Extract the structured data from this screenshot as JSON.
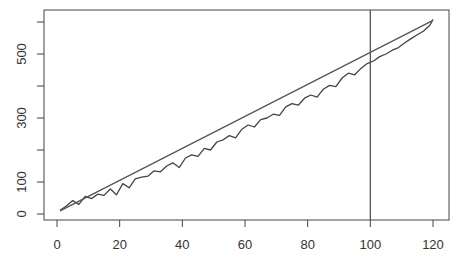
{
  "chart_data": {
    "type": "line",
    "title": "",
    "xlabel": "",
    "ylabel": "",
    "xlim": [
      -3,
      125
    ],
    "ylim": [
      -20,
      640
    ],
    "grid": false,
    "legend": null,
    "x_ticks": [
      0,
      20,
      40,
      60,
      80,
      100,
      120
    ],
    "x_tick_labels": [
      "0",
      "20",
      "40",
      "60",
      "80",
      "100",
      "120"
    ],
    "y_ticks": [
      0,
      100,
      200,
      300,
      400,
      500,
      600
    ],
    "y_tick_labels": [
      "0",
      "100",
      "",
      "300",
      "",
      "500",
      ""
    ],
    "annotations": [
      {
        "type": "vline",
        "x": 100,
        "color": "#555555"
      }
    ],
    "series": [
      {
        "name": "observed",
        "color": "#444444",
        "x": [
          1,
          3,
          5,
          7,
          9,
          11,
          13,
          15,
          17,
          19,
          21,
          23,
          25,
          27,
          29,
          31,
          33,
          35,
          37,
          39,
          41,
          43,
          45,
          47,
          49,
          51,
          53,
          55,
          57,
          59,
          61,
          63,
          65,
          67,
          69,
          71,
          73,
          75,
          77,
          79,
          81,
          83,
          85,
          87,
          89,
          91,
          93,
          95,
          97,
          99,
          101,
          103,
          105,
          107,
          109,
          111,
          113,
          115,
          117,
          119,
          120
        ],
        "values": [
          12,
          25,
          42,
          30,
          55,
          48,
          62,
          58,
          78,
          60,
          95,
          82,
          110,
          115,
          118,
          135,
          132,
          150,
          160,
          145,
          175,
          185,
          180,
          205,
          200,
          225,
          232,
          245,
          238,
          265,
          278,
          272,
          295,
          300,
          312,
          308,
          335,
          345,
          340,
          362,
          372,
          365,
          390,
          402,
          398,
          425,
          440,
          435,
          455,
          470,
          478,
          492,
          500,
          512,
          520,
          535,
          548,
          560,
          572,
          590,
          608
        ]
      },
      {
        "name": "fitted",
        "color": "#555555",
        "x": [
          1,
          10,
          20,
          30,
          40,
          50,
          60,
          70,
          80,
          90,
          100,
          110,
          120
        ],
        "values": [
          10,
          55,
          105,
          155,
          205,
          255,
          305,
          355,
          405,
          455,
          505,
          555,
          605
        ]
      }
    ]
  }
}
